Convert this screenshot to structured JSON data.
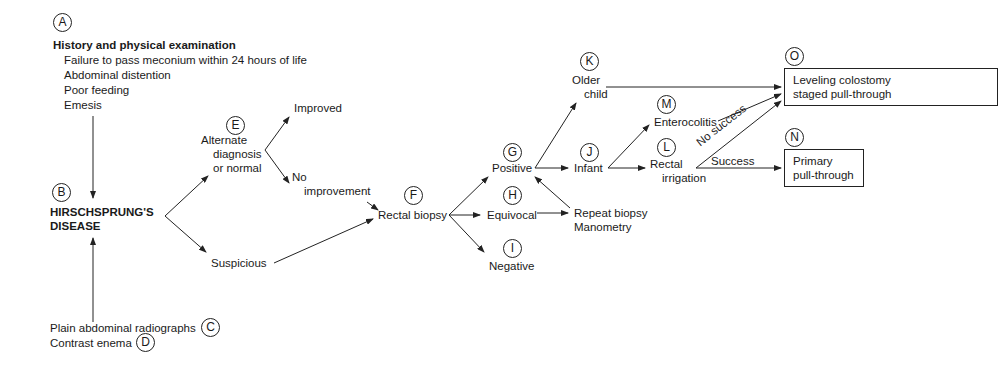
{
  "nodes": {
    "A": {
      "marker": "A",
      "title": "History and physical examination",
      "items": [
        "Failure to pass meconium within 24 hours of life",
        "Abdominal distention",
        "Poor feeding",
        "Emesis"
      ]
    },
    "B": {
      "marker": "B",
      "line1": "HIRSCHSPRUNG'S",
      "line2": "DISEASE"
    },
    "C": {
      "marker": "C",
      "label": "Plain abdominal radiographs"
    },
    "D": {
      "marker": "D",
      "label": "Contrast enema"
    },
    "E": {
      "marker": "E",
      "line1": "Alternate",
      "line2": "diagnosis",
      "line3": "or normal"
    },
    "improved": {
      "label": "Improved"
    },
    "no_improvement": {
      "line1": "No",
      "line2": "improvement"
    },
    "suspicious": {
      "label": "Suspicious"
    },
    "F": {
      "marker": "F",
      "label": "Rectal biopsy"
    },
    "G": {
      "marker": "G",
      "label": "Positive"
    },
    "H": {
      "marker": "H",
      "label": "Equivocal"
    },
    "I": {
      "marker": "I",
      "label": "Negative"
    },
    "repeat": {
      "line1": "Repeat biopsy",
      "line2": "Manometry"
    },
    "K": {
      "marker": "K",
      "line1": "Older",
      "line2": "child"
    },
    "J": {
      "marker": "J",
      "label": "Infant"
    },
    "M": {
      "marker": "M",
      "label": "Enterocolitis"
    },
    "L": {
      "marker": "L",
      "line1": "Rectal",
      "line2": "irrigation"
    },
    "O": {
      "marker": "O",
      "line1": "Leveling colostomy",
      "line2": "staged pull-through"
    },
    "N": {
      "marker": "N",
      "line1": "Primary",
      "line2": "pull-through"
    }
  },
  "edge_labels": {
    "no_success": "No success",
    "success": "Success"
  }
}
